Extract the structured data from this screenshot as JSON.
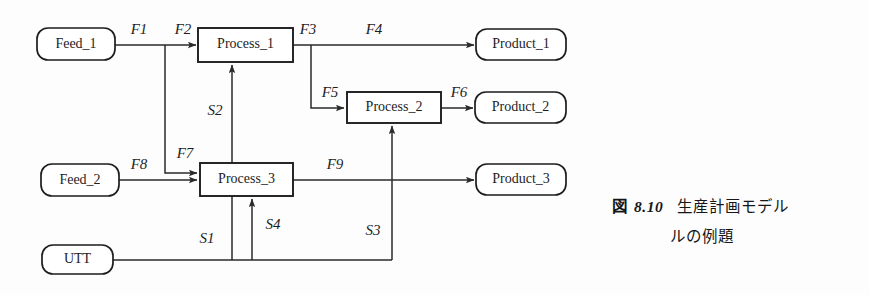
{
  "figure": {
    "caption_fig_word": "図",
    "caption_number": "8.10",
    "caption_line1": "生産計画モデル",
    "caption_line2": "ルの例題",
    "background_color": "#fdfdfd",
    "line_color": "#2a2a2c",
    "node_fill": "#ffffff"
  },
  "nodes": [
    {
      "id": "feed_1",
      "label": "Feed_1",
      "shape": "rounded",
      "x": 37,
      "y": 28,
      "w": 78,
      "h": 32
    },
    {
      "id": "feed_2",
      "label": "Feed_2",
      "shape": "rounded",
      "x": 41,
      "y": 164,
      "w": 78,
      "h": 32
    },
    {
      "id": "utt",
      "label": "UTT",
      "shape": "rounded",
      "x": 42,
      "y": 245,
      "w": 71,
      "h": 29
    },
    {
      "id": "process_1",
      "label": "Process_1",
      "shape": "rect",
      "x": 198,
      "y": 28,
      "w": 95,
      "h": 34
    },
    {
      "id": "process_2",
      "label": "Process_2",
      "shape": "rect",
      "x": 347,
      "y": 92,
      "w": 94,
      "h": 31
    },
    {
      "id": "process_3",
      "label": "Process_3",
      "shape": "rect",
      "x": 200,
      "y": 163,
      "w": 93,
      "h": 33
    },
    {
      "id": "product_1",
      "label": "Product_1",
      "shape": "rounded",
      "x": 476,
      "y": 29,
      "w": 90,
      "h": 31
    },
    {
      "id": "product_2",
      "label": "Product_2",
      "shape": "rounded",
      "x": 475,
      "y": 92,
      "w": 91,
      "h": 31
    },
    {
      "id": "product_3",
      "label": "Product_3",
      "shape": "rounded",
      "x": 476,
      "y": 164,
      "w": 90,
      "h": 31
    }
  ],
  "edges": [
    {
      "id": "F1",
      "label": "F1",
      "from": "feed_1",
      "to": "branch_f2",
      "label_x": 139,
      "label_y": 31
    },
    {
      "id": "F2",
      "label": "F2",
      "from": "branch_f2",
      "to": "process_1",
      "label_x": 183,
      "label_y": 31
    },
    {
      "id": "F3",
      "label": "F3",
      "from": "process_1",
      "to": "branch_f3",
      "label_x": 308,
      "label_y": 31
    },
    {
      "id": "F4",
      "label": "F4",
      "from": "branch_f3",
      "to": "product_1",
      "label_x": 374,
      "label_y": 31
    },
    {
      "id": "F5",
      "label": "F5",
      "from": "branch_f3",
      "to": "process_2",
      "label_x": 330,
      "label_y": 94
    },
    {
      "id": "F6",
      "label": "F6",
      "from": "process_2",
      "to": "product_2",
      "label_x": 459,
      "label_y": 94
    },
    {
      "id": "F7",
      "label": "F7",
      "from": "branch_f2",
      "to": "process_3",
      "label_x": 185,
      "label_y": 155
    },
    {
      "id": "F8",
      "label": "F8",
      "from": "feed_2",
      "to": "process_3",
      "label_x": 139,
      "label_y": 166
    },
    {
      "id": "F9",
      "label": "F9",
      "from": "process_3",
      "to": "product_3",
      "label_x": 335,
      "label_y": 166
    },
    {
      "id": "S1",
      "label": "S1",
      "from": "utt",
      "to": "bottom_rail",
      "label_x": 207,
      "label_y": 240
    },
    {
      "id": "S2",
      "label": "S2",
      "from": "process_3",
      "to": "process_1",
      "label_x": 215,
      "label_y": 112
    },
    {
      "id": "S3",
      "label": "S3",
      "from": "bottom_rail",
      "to": "process_2",
      "label_x": 373,
      "label_y": 232
    },
    {
      "id": "S4",
      "label": "S4",
      "from": "bottom_rail",
      "to": "process_3",
      "label_x": 273,
      "label_y": 226
    }
  ]
}
